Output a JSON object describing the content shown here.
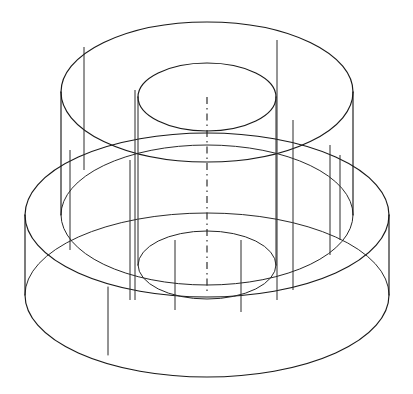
{
  "document": {
    "title": "Isometric Wireframe — Stepped Cylindrical Boss",
    "drawing_type": "isometric-wireframe",
    "background_color": "#ffffff",
    "line_color": "#1a1a1a",
    "hidden_line_color": "#2b2b2b",
    "centerline_color": "#1a1a1a",
    "canvas": {
      "width": 413,
      "height": 394
    }
  },
  "geometry": {
    "description": "Two coaxial stacked cylinders (large base disc and smaller upper boss) pierced by a central through-bore, drawn in isometric wireframe with all hidden edges shown.",
    "axis_center_x": 207,
    "features": [
      {
        "name": "base-disc",
        "kind": "cylinder",
        "center_x": 207,
        "top_center_y": 215,
        "radius_x": 182,
        "radius_y": 82,
        "height": 80
      },
      {
        "name": "upper-boss",
        "kind": "cylinder",
        "center_x": 207,
        "top_center_y": 92,
        "radius_x": 146,
        "radius_y": 70,
        "height": 123
      },
      {
        "name": "through-bore",
        "kind": "cylinder-hole",
        "center_x": 207,
        "top_center_y": 97,
        "radius_x": 69,
        "radius_y": 34,
        "height": 168
      }
    ],
    "centerline": {
      "name": "axis-centerline",
      "x": 207,
      "y_start": 97,
      "y_end": 292,
      "style": "dash-dot"
    }
  },
  "ellipses": {
    "base_top": {
      "cx": 207,
      "cy": 215,
      "rx": 182,
      "ry": 82
    },
    "base_bottom": {
      "cx": 207,
      "cy": 295,
      "rx": 182,
      "ry": 82
    },
    "boss_top": {
      "cx": 207,
      "cy": 92,
      "rx": 146,
      "ry": 70
    },
    "boss_bottom": {
      "cx": 207,
      "cy": 215,
      "rx": 146,
      "ry": 70
    },
    "bore_top": {
      "cx": 207,
      "cy": 97,
      "rx": 69,
      "ry": 34
    },
    "bore_bottom": {
      "cx": 207,
      "cy": 265,
      "rx": 69,
      "ry": 34
    }
  },
  "vertical_edges": {
    "base_left_x": 25,
    "base_right_x": 389,
    "boss_left_x": 61,
    "boss_right_x": 353,
    "bore_left_x": 138,
    "bore_right_x": 276,
    "base_seam_x": 108
  },
  "labels": {
    "none_visible": ""
  }
}
